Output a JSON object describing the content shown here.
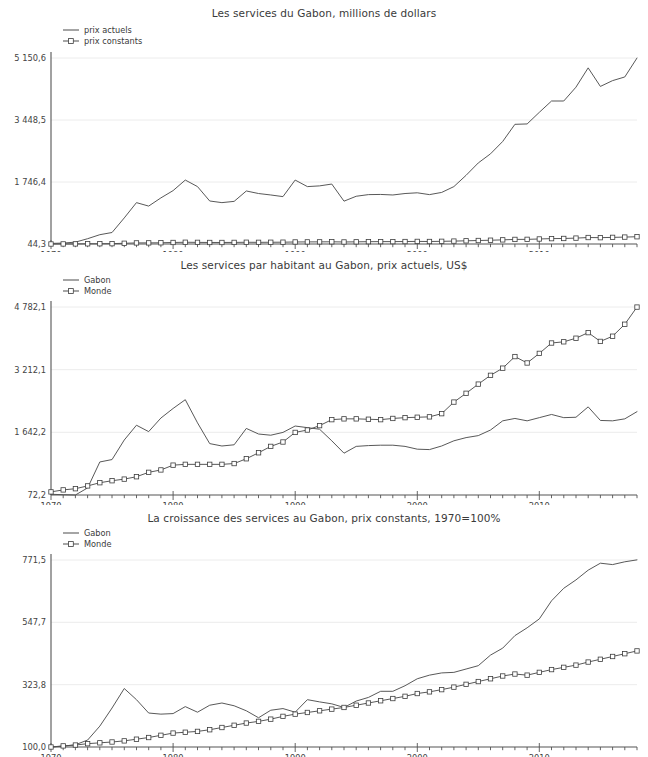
{
  "page": {
    "width": 648,
    "height": 728,
    "background": "#ffffff",
    "line_color": "#4f4f4f",
    "grid_color": "#ececec",
    "axis_color": "#545454"
  },
  "chart_data": [
    {
      "type": "line",
      "title": "Les services du Gabon, millions de dollars",
      "xlabel": "",
      "ylabel": "",
      "grid": true,
      "legend_position": "top-left",
      "x": [
        1970,
        1971,
        1972,
        1973,
        1974,
        1975,
        1976,
        1977,
        1978,
        1979,
        1980,
        1981,
        1982,
        1983,
        1984,
        1985,
        1986,
        1987,
        1988,
        1989,
        1990,
        1991,
        1992,
        1993,
        1994,
        1995,
        1996,
        1997,
        1998,
        1999,
        2000,
        2001,
        2002,
        2003,
        2004,
        2005,
        2006,
        2007,
        2008,
        2009,
        2010,
        2011,
        2012,
        2013,
        2014,
        2015,
        2016,
        2017,
        2018
      ],
      "xticks": [
        1970,
        1980,
        1990,
        2000,
        2010
      ],
      "yticks": [
        44.3,
        1746.4,
        3448.5,
        5150.6
      ],
      "yticklabels": [
        "44,3",
        "1 746,4",
        "3 448,5",
        "5 150,6"
      ],
      "ylim": [
        44.3,
        5150.6
      ],
      "xlim": [
        1970,
        2018
      ],
      "series": [
        {
          "name": "prix actuels",
          "marker": "none",
          "values": [
            60,
            70,
            95,
            190,
            300,
            360,
            760,
            1180,
            1085,
            1310,
            1510,
            1800,
            1620,
            1225,
            1180,
            1215,
            1500,
            1430,
            1390,
            1345,
            1800,
            1620,
            1640,
            1690,
            1220,
            1355,
            1400,
            1405,
            1390,
            1430,
            1450,
            1400,
            1460,
            1620,
            1930,
            2270,
            2520,
            2860,
            3330,
            3340,
            3660,
            3970,
            3970,
            4350,
            4880,
            4370,
            4530,
            4630,
            5150
          ]
        },
        {
          "name": "prix constants",
          "marker": "square",
          "values": [
            44.3,
            46,
            47,
            50,
            52,
            54,
            64,
            74,
            75,
            78,
            86,
            92,
            89,
            86,
            86,
            88,
            92,
            90,
            92,
            94,
            100,
            102,
            103,
            105,
            100,
            104,
            108,
            110,
            110,
            112,
            115,
            113,
            118,
            124,
            132,
            140,
            148,
            158,
            170,
            172,
            182,
            192,
            196,
            206,
            222,
            218,
            226,
            234,
            244
          ]
        }
      ]
    },
    {
      "type": "line",
      "title": "Les services par habitant au Gabon, prix actuels, US$",
      "xlabel": "",
      "ylabel": "",
      "grid": true,
      "legend_position": "top-left",
      "x": [
        1970,
        1971,
        1972,
        1973,
        1974,
        1975,
        1976,
        1977,
        1978,
        1979,
        1980,
        1981,
        1982,
        1983,
        1984,
        1985,
        1986,
        1987,
        1988,
        1989,
        1990,
        1991,
        1992,
        1993,
        1994,
        1995,
        1996,
        1997,
        1998,
        1999,
        2000,
        2001,
        2002,
        2003,
        2004,
        2005,
        2006,
        2007,
        2008,
        2009,
        2010,
        2011,
        2012,
        2013,
        2014,
        2015,
        2016,
        2017,
        2018
      ],
      "xticks": [
        1970,
        1980,
        1990,
        2000,
        2010
      ],
      "yticks": [
        72.2,
        1642.2,
        3212.1,
        4782.1
      ],
      "yticklabels": [
        "72,2",
        "1 642,2",
        "3 212,1",
        "4 782,1"
      ],
      "ylim": [
        72.2,
        4782.1
      ],
      "xlim": [
        1970,
        2018
      ],
      "series": [
        {
          "name": "Gabon",
          "marker": "none",
          "values": [
            90,
            80,
            72,
            250,
            900,
            960,
            1450,
            1820,
            1660,
            2000,
            2240,
            2460,
            1880,
            1360,
            1300,
            1330,
            1740,
            1600,
            1570,
            1640,
            1800,
            1760,
            1720,
            1430,
            1120,
            1290,
            1310,
            1320,
            1320,
            1290,
            1220,
            1210,
            1300,
            1430,
            1510,
            1560,
            1700,
            1930,
            1990,
            1930,
            2010,
            2090,
            2010,
            2020,
            2280,
            1940,
            1930,
            1980,
            2160
          ]
        },
        {
          "name": "Monde",
          "marker": "square",
          "values": [
            150,
            200,
            230,
            300,
            380,
            430,
            470,
            530,
            640,
            700,
            820,
            840,
            840,
            840,
            840,
            860,
            980,
            1130,
            1290,
            1400,
            1640,
            1700,
            1810,
            1960,
            1980,
            1980,
            1970,
            1960,
            1990,
            2010,
            2020,
            2030,
            2110,
            2400,
            2620,
            2850,
            3070,
            3250,
            3540,
            3380,
            3620,
            3880,
            3910,
            4000,
            4140,
            3920,
            4050,
            4350,
            4780
          ]
        }
      ]
    },
    {
      "type": "line",
      "title": "La croissance des services au Gabon, prix constants, 1970=100%",
      "xlabel": "",
      "ylabel": "",
      "grid": true,
      "legend_position": "top-left",
      "x": [
        1970,
        1971,
        1972,
        1973,
        1974,
        1975,
        1976,
        1977,
        1978,
        1979,
        1980,
        1981,
        1982,
        1983,
        1984,
        1985,
        1986,
        1987,
        1988,
        1989,
        1990,
        1991,
        1992,
        1993,
        1994,
        1995,
        1996,
        1997,
        1998,
        1999,
        2000,
        2001,
        2002,
        2003,
        2004,
        2005,
        2006,
        2007,
        2008,
        2009,
        2010,
        2011,
        2012,
        2013,
        2014,
        2015,
        2016,
        2017,
        2018
      ],
      "xticks": [
        1970,
        1980,
        1990,
        2000,
        2010
      ],
      "yticks": [
        100.0,
        323.8,
        547.7,
        771.5
      ],
      "yticklabels": [
        "100,0",
        "323,8",
        "547,7",
        "771,5"
      ],
      "ylim": [
        100.0,
        771.5
      ],
      "xlim": [
        1970,
        2018
      ],
      "series": [
        {
          "name": "Gabon",
          "marker": "none",
          "values": [
            100,
            103,
            108,
            125,
            175,
            240,
            310,
            270,
            222,
            218,
            220,
            245,
            225,
            250,
            258,
            248,
            230,
            205,
            232,
            238,
            225,
            270,
            262,
            255,
            242,
            265,
            278,
            300,
            300,
            320,
            345,
            358,
            366,
            368,
            380,
            392,
            430,
            455,
            500,
            528,
            560,
            625,
            670,
            700,
            735,
            760,
            755,
            765,
            772
          ]
        },
        {
          "name": "Monde",
          "marker": "square",
          "values": [
            100,
            104,
            107,
            112,
            115,
            118,
            122,
            128,
            134,
            142,
            150,
            153,
            156,
            162,
            170,
            178,
            186,
            192,
            200,
            210,
            218,
            224,
            230,
            236,
            242,
            250,
            258,
            266,
            274,
            282,
            292,
            298,
            306,
            315,
            325,
            335,
            345,
            355,
            362,
            358,
            368,
            378,
            386,
            394,
            405,
            415,
            425,
            435,
            445
          ]
        }
      ]
    }
  ],
  "legend_markers": {
    "none": "plain-line",
    "square": "line-with-square-marker"
  }
}
